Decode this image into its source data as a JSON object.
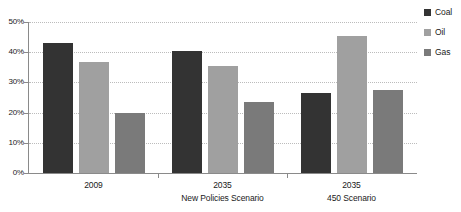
{
  "chart_data": {
    "type": "bar",
    "title": "",
    "subtitle": "",
    "xlabel": "",
    "ylabel": "",
    "ylim": [
      0,
      50
    ],
    "yticks": [
      0,
      10,
      20,
      30,
      40,
      50
    ],
    "ytick_labels": [
      "0%",
      "10%",
      "20%",
      "30%",
      "40%",
      "50%"
    ],
    "grid": true,
    "legend_position": "right",
    "categories": [
      "2009",
      "2035",
      "2035"
    ],
    "category_sublabels": [
      "",
      "New Policies Scenario",
      "450 Scenario"
    ],
    "series": [
      {
        "name": "Coal",
        "color": "#333333",
        "values": [
          43.0,
          40.5,
          26.5
        ]
      },
      {
        "name": "Oil",
        "color": "#a0a0a0",
        "values": [
          36.7,
          35.5,
          45.5
        ]
      },
      {
        "name": "Gas",
        "color": "#7a7a7a",
        "values": [
          20.0,
          23.5,
          27.5
        ]
      }
    ]
  },
  "axis": {
    "y_labels": [
      "50%",
      "40%",
      "30%",
      "20%",
      "10%",
      "0%"
    ]
  },
  "legend": {
    "items": [
      {
        "label": "Coal",
        "color": "#333333"
      },
      {
        "label": "Oil",
        "color": "#a0a0a0"
      },
      {
        "label": "Gas",
        "color": "#7a7a7a"
      }
    ]
  },
  "x_axis": {
    "groups": [
      {
        "line1": "2009",
        "line2": ""
      },
      {
        "line1": "2035",
        "line2": "New Policies Scenario"
      },
      {
        "line1": "2035",
        "line2": "450 Scenario"
      }
    ]
  }
}
